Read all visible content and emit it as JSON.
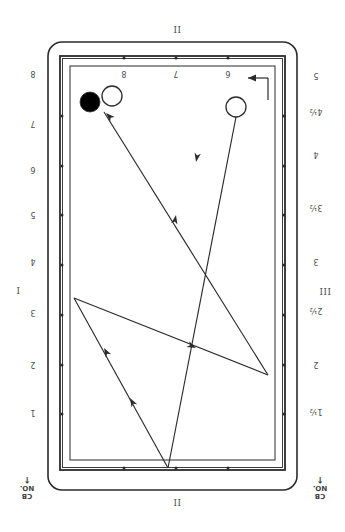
{
  "diagram": {
    "type": "billiard-diamond-system",
    "title_top": "II",
    "title_bottom": "II",
    "title_left": "I",
    "title_right": "III"
  },
  "labels": {
    "top_rail": [
      {
        "text": "8",
        "x": 124,
        "y": 74
      },
      {
        "text": "7",
        "x": 176,
        "y": 74
      },
      {
        "text": "6",
        "x": 228,
        "y": 74
      }
    ],
    "left_rail": [
      {
        "text": "8",
        "x": 33,
        "y": 74
      },
      {
        "text": "7",
        "x": 33,
        "y": 124
      },
      {
        "text": "6",
        "x": 33,
        "y": 170
      },
      {
        "text": "5",
        "x": 33,
        "y": 215
      },
      {
        "text": "4",
        "x": 33,
        "y": 262
      },
      {
        "text": "3",
        "x": 33,
        "y": 313
      },
      {
        "text": "2",
        "x": 33,
        "y": 365
      },
      {
        "text": "1",
        "x": 33,
        "y": 413
      }
    ],
    "right_rail": [
      {
        "text": "5",
        "x": 316,
        "y": 76
      },
      {
        "text": "4¹⁄₂",
        "x": 316,
        "y": 112
      },
      {
        "text": "4",
        "x": 316,
        "y": 155
      },
      {
        "text": "3¹⁄₂",
        "x": 316,
        "y": 208
      },
      {
        "text": "3",
        "x": 316,
        "y": 262
      },
      {
        "text": "2¹⁄₂",
        "x": 316,
        "y": 311
      },
      {
        "text": "2",
        "x": 316,
        "y": 365
      },
      {
        "text": "1¹⁄₂",
        "x": 316,
        "y": 412
      }
    ],
    "corner_left": {
      "line1": "CB",
      "line2": "NO.",
      "x": 27,
      "y": 487
    },
    "corner_right": {
      "line1": "CB",
      "line2": "NO.",
      "x": 320,
      "y": 487
    },
    "roman_top": {
      "text": "II",
      "x": 177,
      "y": 29
    },
    "roman_bottom": {
      "text": "II",
      "x": 177,
      "y": 502
    },
    "roman_left": {
      "text": "I",
      "x": 18,
      "y": 290
    },
    "roman_right": {
      "text": "III",
      "x": 325,
      "y": 291
    }
  },
  "balls": [
    {
      "name": "object-ball-dark",
      "cx": 90,
      "cy": 102,
      "r": 10,
      "fill": "#000000"
    },
    {
      "name": "object-ball-light",
      "cx": 112,
      "cy": 96,
      "r": 10,
      "fill": "#ffffff"
    },
    {
      "name": "cue-ball",
      "cx": 236,
      "cy": 107,
      "r": 10,
      "fill": "#ffffff"
    }
  ],
  "path": {
    "segments": [
      {
        "from": [
          236,
          117
        ],
        "to": [
          168,
          468
        ]
      },
      {
        "from": [
          168,
          468
        ],
        "to": [
          74,
          298
        ]
      },
      {
        "from": [
          74,
          298
        ],
        "to": [
          268,
          375
        ]
      },
      {
        "from": [
          268,
          375
        ],
        "to": [
          104,
          112
        ]
      }
    ],
    "arrows": [
      {
        "x": 196,
        "y": 162,
        "angle": 101
      },
      {
        "x": 176,
        "y": 215,
        "angle": 281
      },
      {
        "x": 130,
        "y": 398,
        "angle": 241
      },
      {
        "x": 104,
        "y": 348,
        "angle": 241
      },
      {
        "x": 196,
        "y": 348,
        "angle": 25
      },
      {
        "x": 106,
        "y": 113,
        "angle": 225
      }
    ]
  },
  "table": {
    "outer": {
      "x": 48,
      "y": 42,
      "w": 249,
      "h": 448,
      "rx": 14
    },
    "mid": {
      "x": 60,
      "y": 56,
      "w": 225,
      "h": 414
    },
    "inner": {
      "x": 70,
      "y": 66,
      "w": 205,
      "h": 394
    }
  },
  "diamonds": {
    "top": [
      {
        "x": 124,
        "y": 58
      },
      {
        "x": 176,
        "y": 58
      },
      {
        "x": 228,
        "y": 58
      }
    ],
    "bottom": [
      {
        "x": 124,
        "y": 468
      },
      {
        "x": 176,
        "y": 468
      },
      {
        "x": 228,
        "y": 468
      }
    ],
    "left": [
      {
        "x": 62,
        "y": 116
      },
      {
        "x": 62,
        "y": 166
      },
      {
        "x": 62,
        "y": 215
      },
      {
        "x": 62,
        "y": 265
      },
      {
        "x": 62,
        "y": 315
      },
      {
        "x": 62,
        "y": 365
      },
      {
        "x": 62,
        "y": 414
      }
    ],
    "right": [
      {
        "x": 284,
        "y": 116
      },
      {
        "x": 284,
        "y": 166
      },
      {
        "x": 284,
        "y": 215
      },
      {
        "x": 284,
        "y": 265
      },
      {
        "x": 284,
        "y": 315
      },
      {
        "x": 284,
        "y": 365
      },
      {
        "x": 284,
        "y": 414
      }
    ]
  },
  "direction_arrow": {
    "name": "entry-direction-arrow",
    "x1": 268,
    "y1": 78,
    "x2": 248,
    "y2": 78
  },
  "colors": {
    "line": "#2b2b2b",
    "text": "#4d4d4d",
    "background": "#ffffff"
  }
}
